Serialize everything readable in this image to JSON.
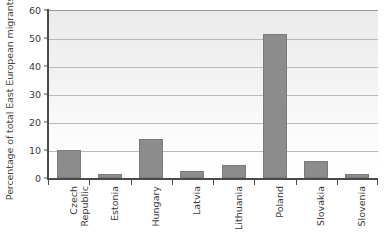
{
  "chart_data": {
    "type": "bar",
    "title": "",
    "subtitle": "",
    "xlabel": "",
    "ylabel": "Percentage of total East European migrants",
    "ylim": [
      0,
      60
    ],
    "yticks": [
      0,
      10,
      20,
      30,
      40,
      50,
      60
    ],
    "ytick_labels": [
      "0",
      "10",
      "20",
      "30",
      "40",
      "50",
      "60"
    ],
    "grid": "horizontal",
    "legend": "none",
    "categories": [
      "Czech Republic",
      "Estonia",
      "Hungary",
      "Latvia",
      "Lithuania",
      "Poland",
      "Slovakia",
      "Slovenia"
    ],
    "category_lines": [
      [
        "Czech",
        "Republic"
      ],
      [
        "Estonia",
        ""
      ],
      [
        "Hungary",
        ""
      ],
      [
        "Latvia",
        ""
      ],
      [
        "Lithuania",
        ""
      ],
      [
        "Poland",
        ""
      ],
      [
        "Slovakia",
        ""
      ],
      [
        "Slovenia",
        ""
      ]
    ],
    "values": [
      10,
      1.5,
      14,
      2.5,
      4.5,
      51.5,
      6,
      1.5
    ],
    "bar_color": "#8c8c8c",
    "bar_edge_color": "#7a7a7a",
    "plot_background": "#f0f0f0",
    "gridline_color": "#b9b9b9",
    "axis_color": "#4a4a4a",
    "text_color": "#3a3a3a"
  }
}
